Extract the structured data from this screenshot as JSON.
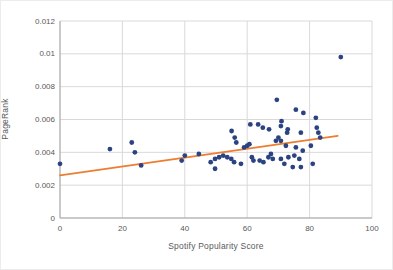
{
  "chart_data": {
    "type": "scatter",
    "title": "",
    "xlabel": "Spotify Popularity Score",
    "ylabel": "PageRank",
    "xlim": [
      0,
      100
    ],
    "ylim": [
      0,
      0.012
    ],
    "xticks": [
      0,
      20,
      40,
      60,
      80,
      100
    ],
    "xtick_labels": [
      "0",
      "20",
      "40",
      "60",
      "80",
      "100"
    ],
    "yticks": [
      0,
      0.002,
      0.004,
      0.006,
      0.008,
      0.01,
      0.012
    ],
    "ytick_labels": [
      "0",
      "0.002",
      "0.004",
      "0.006",
      "0.008",
      "0.01",
      "0.012"
    ],
    "grid": true,
    "legend": "none",
    "colors": {
      "point": "#2c4382",
      "trendline": "#ed7d31",
      "gridline": "#d9d9d9",
      "axis_line": "#a6a6a6",
      "label_text": "#595959"
    },
    "series": [
      {
        "name": "PageRank vs Spotify Popularity",
        "marker": "circle",
        "points": [
          [
            0,
            0.0033
          ],
          [
            16,
            0.0042
          ],
          [
            23,
            0.0046
          ],
          [
            24,
            0.004
          ],
          [
            26,
            0.0032
          ],
          [
            39,
            0.0035
          ],
          [
            40,
            0.0038
          ],
          [
            44.5,
            0.0039
          ],
          [
            48.3,
            0.0034
          ],
          [
            49.7,
            0.0036
          ],
          [
            49.7,
            0.003
          ],
          [
            51,
            0.0037
          ],
          [
            52.3,
            0.0038
          ],
          [
            53.6,
            0.0037
          ],
          [
            54.9,
            0.0036
          ],
          [
            55.8,
            0.0034
          ],
          [
            55,
            0.0053
          ],
          [
            56,
            0.0049
          ],
          [
            56.5,
            0.0046
          ],
          [
            58,
            0.0033
          ],
          [
            59,
            0.0043
          ],
          [
            60,
            0.0044
          ],
          [
            60.7,
            0.0045
          ],
          [
            61,
            0.0057
          ],
          [
            61.5,
            0.0037
          ],
          [
            62,
            0.0035
          ],
          [
            63.5,
            0.0057
          ],
          [
            64,
            0.0035
          ],
          [
            65,
            0.0055
          ],
          [
            65.2,
            0.0034
          ],
          [
            67,
            0.0054
          ],
          [
            66.8,
            0.0037
          ],
          [
            67.6,
            0.0039
          ],
          [
            68.2,
            0.0036
          ],
          [
            69.2,
            0.0047
          ],
          [
            70,
            0.0049
          ],
          [
            69.5,
            0.0072
          ],
          [
            71,
            0.0059
          ],
          [
            70.8,
            0.0056
          ],
          [
            73,
            0.0054
          ],
          [
            70.8,
            0.0047
          ],
          [
            72.4,
            0.0044
          ],
          [
            72.8,
            0.0052
          ],
          [
            75.6,
            0.0066
          ],
          [
            75.6,
            0.0043
          ],
          [
            77.2,
            0.0052
          ],
          [
            78,
            0.0064
          ],
          [
            77.8,
            0.0041
          ],
          [
            75.1,
            0.0038
          ],
          [
            73.2,
            0.0037
          ],
          [
            76.7,
            0.0036
          ],
          [
            80.4,
            0.0044
          ],
          [
            70.8,
            0.0036
          ],
          [
            71.9,
            0.0033
          ],
          [
            74.6,
            0.0031
          ],
          [
            81,
            0.0033
          ],
          [
            77.2,
            0.0031
          ],
          [
            82,
            0.0061
          ],
          [
            82.3,
            0.0055
          ],
          [
            82.8,
            0.0052
          ],
          [
            83.4,
            0.0049
          ],
          [
            90,
            0.0098
          ]
        ]
      }
    ],
    "trendline": {
      "x1": 0,
      "y1": 0.0026,
      "x2": 89,
      "y2": 0.005
    }
  }
}
